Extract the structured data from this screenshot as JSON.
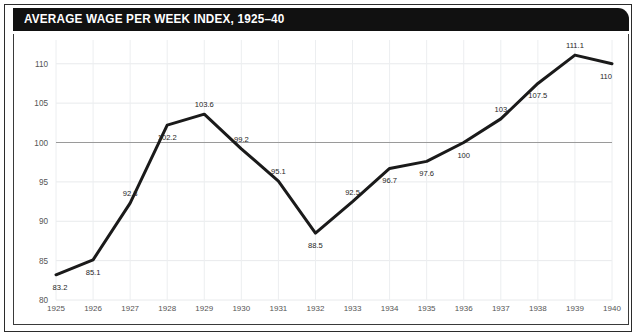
{
  "figure": {
    "title": "AVERAGE WAGE PER WEEK INDEX, 1925–40",
    "title_bar_color": "#111111",
    "title_text_color": "#ffffff",
    "frame_color": "#2b2b2b",
    "background": "#ffffff"
  },
  "chart_data": {
    "type": "line",
    "title": "AVERAGE WAGE PER WEEK INDEX, 1925–40",
    "xlabel": "",
    "ylabel": "",
    "xlim": [
      1925,
      1940
    ],
    "ylim": [
      80,
      112
    ],
    "grid": true,
    "legend": "none",
    "line_color": "#1a1a1a",
    "line_width": 3,
    "reference_line": {
      "value": 100,
      "color": "#9a9a9a",
      "label": "100 index baseline"
    },
    "yticks": [
      80,
      85,
      90,
      95,
      100,
      105,
      110
    ],
    "ytick_labels": [
      "80",
      "85",
      "90",
      "95",
      "100",
      "105",
      "110"
    ],
    "categories": [
      1925,
      1926,
      1927,
      1928,
      1929,
      1930,
      1931,
      1932,
      1933,
      1934,
      1935,
      1936,
      1937,
      1938,
      1939,
      1940
    ],
    "xtick_labels": [
      "1925",
      "1926",
      "1927",
      "1928",
      "1929",
      "1930",
      "1931",
      "1932",
      "1933",
      "1934",
      "1935",
      "1936",
      "1937",
      "1938",
      "1939",
      "1940"
    ],
    "values": [
      83.2,
      85.1,
      92.3,
      102.2,
      103.6,
      99.2,
      95.1,
      88.5,
      92.5,
      96.7,
      97.6,
      100,
      103,
      107.5,
      111.1,
      110
    ],
    "point_labels": [
      "83.2",
      "85.1",
      "92.3",
      "102.2",
      "103.6",
      "99.2",
      "95.1",
      "88.5",
      "92.5",
      "96.7",
      "97.6",
      "100",
      "103",
      "107.5",
      "111.1",
      "110"
    ],
    "point_label_placement": [
      "below",
      "below",
      "above",
      "below",
      "above",
      "above",
      "above",
      "below",
      "above",
      "below",
      "below",
      "below",
      "above",
      "below",
      "above",
      "below"
    ]
  }
}
